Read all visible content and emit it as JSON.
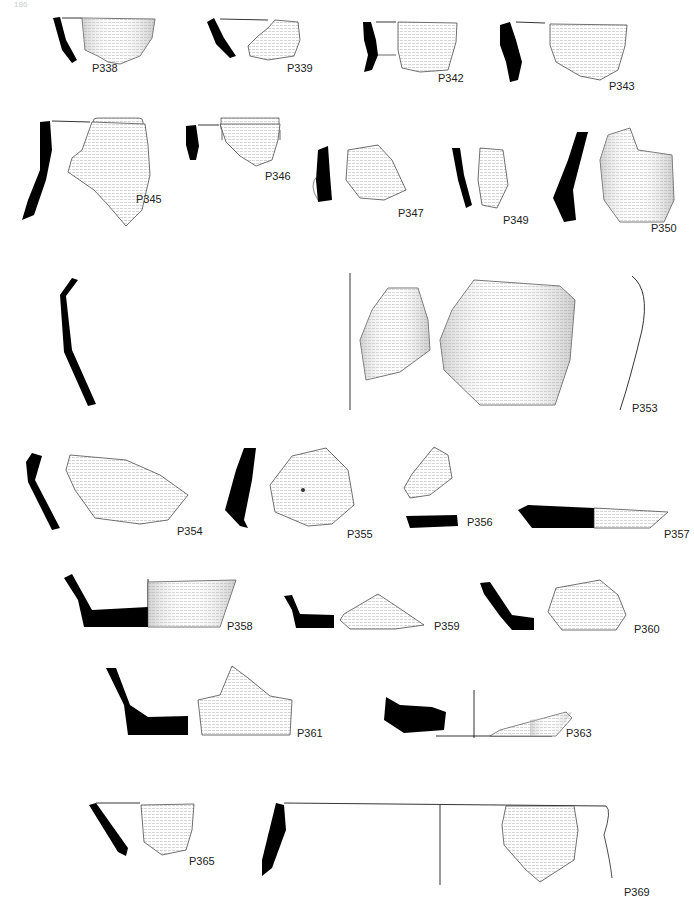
{
  "page": {
    "number": "186"
  },
  "figures": [
    {
      "id": "P338",
      "label": "P338",
      "x": 92,
      "y": 62
    },
    {
      "id": "P339",
      "label": "P339",
      "x": 287,
      "y": 62
    },
    {
      "id": "P342",
      "label": "P342",
      "x": 438,
      "y": 72
    },
    {
      "id": "P343",
      "label": "P343",
      "x": 609,
      "y": 80
    },
    {
      "id": "P345",
      "label": "P345",
      "x": 136,
      "y": 193
    },
    {
      "id": "P346",
      "label": "P346",
      "x": 265,
      "y": 170
    },
    {
      "id": "P347",
      "label": "P347",
      "x": 398,
      "y": 207
    },
    {
      "id": "P349",
      "label": "P349",
      "x": 503,
      "y": 214
    },
    {
      "id": "P350",
      "label": "P350",
      "x": 651,
      "y": 222
    },
    {
      "id": "P353",
      "label": "P353",
      "x": 632,
      "y": 402
    },
    {
      "id": "P354",
      "label": "P354",
      "x": 177,
      "y": 525
    },
    {
      "id": "P355",
      "label": "P355",
      "x": 347,
      "y": 528
    },
    {
      "id": "P356",
      "label": "P356",
      "x": 467,
      "y": 516
    },
    {
      "id": "P357",
      "label": "P357",
      "x": 664,
      "y": 528
    },
    {
      "id": "P358",
      "label": "P358",
      "x": 227,
      "y": 620
    },
    {
      "id": "P359",
      "label": "P359",
      "x": 434,
      "y": 620
    },
    {
      "id": "P360",
      "label": "P360",
      "x": 634,
      "y": 623
    },
    {
      "id": "P361",
      "label": "P361",
      "x": 297,
      "y": 727
    },
    {
      "id": "P363",
      "label": "P363",
      "x": 566,
      "y": 727
    },
    {
      "id": "P365",
      "label": "P365",
      "x": 189,
      "y": 855
    },
    {
      "id": "P369",
      "label": "P369",
      "x": 624,
      "y": 886
    }
  ]
}
